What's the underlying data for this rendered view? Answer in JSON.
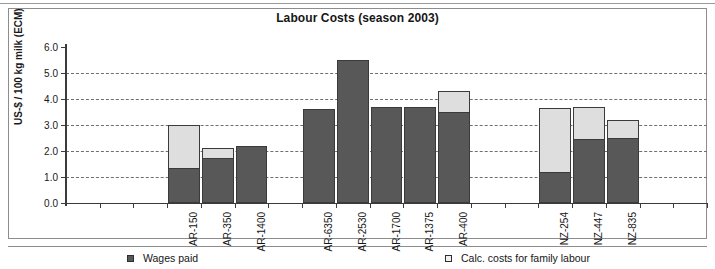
{
  "chart_data": {
    "type": "bar",
    "title": "Labour Costs (season 2003)",
    "xlabel": "",
    "ylabel": "US-$ / 100 kg milk (ECM)",
    "ylim": [
      0.0,
      6.0
    ],
    "ytick_labels": [
      "6.0",
      "5.0",
      "4.0",
      "3.0",
      "2.0",
      "1.0",
      "0.0"
    ],
    "ytick_values": [
      6.0,
      5.0,
      4.0,
      3.0,
      2.0,
      1.0,
      0.0
    ],
    "grid": "horizontal-dashed",
    "stacked": true,
    "legend_position": "bottom",
    "legend": [
      "Wages paid",
      "Calc. costs for family labour"
    ],
    "categories": [
      "",
      "",
      "",
      "AR-150",
      "AR-350",
      "AR-1400",
      "",
      "AR-6350",
      "AR-2530",
      "AR-1700",
      "AR-1375",
      "AR-400",
      "",
      "",
      "NZ-254",
      "NZ-447",
      "NZ-835",
      "",
      ""
    ],
    "series": [
      {
        "name": "Wages paid",
        "color": "#585858",
        "values": [
          null,
          null,
          null,
          1.35,
          1.75,
          2.2,
          null,
          3.6,
          5.5,
          3.7,
          3.7,
          3.5,
          null,
          null,
          1.2,
          2.45,
          2.5,
          null,
          null
        ]
      },
      {
        "name": "Calc. costs for family labour",
        "color": "#dedede",
        "values": [
          null,
          null,
          null,
          1.65,
          0.35,
          0.0,
          null,
          0.0,
          0.0,
          0.0,
          0.0,
          0.8,
          null,
          null,
          2.45,
          1.25,
          0.7,
          null,
          null
        ]
      }
    ],
    "totals": [
      null,
      null,
      null,
      3.0,
      2.1,
      2.2,
      null,
      3.6,
      5.5,
      3.7,
      3.7,
      4.3,
      null,
      null,
      3.65,
      3.7,
      3.2,
      null,
      null
    ]
  }
}
